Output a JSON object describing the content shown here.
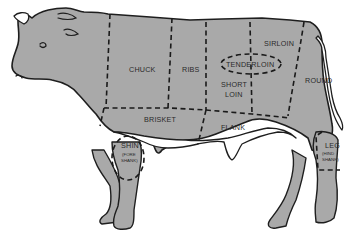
{
  "diagram": {
    "colors": {
      "body_fill": "#a9a9a9",
      "outline": "#1e1e1e",
      "background": "#ffffff"
    },
    "cuts": [
      {
        "id": "chuck",
        "label": "CHUCK"
      },
      {
        "id": "ribs",
        "label": "RIBS"
      },
      {
        "id": "sirloin",
        "label": "SIRLOIN"
      },
      {
        "id": "tenderloin",
        "label": "TENDERLOIN"
      },
      {
        "id": "short-loin",
        "label_line1": "SHORT",
        "label_line2": "LOIN"
      },
      {
        "id": "round",
        "label": "ROUND"
      },
      {
        "id": "brisket",
        "label": "BRISKET"
      },
      {
        "id": "flank",
        "label": "FLANK"
      },
      {
        "id": "shin",
        "label": "SHIN",
        "sub_line1": "(FORE",
        "sub_line2": "SHANK)"
      },
      {
        "id": "leg",
        "label": "LEG",
        "sub_line1": "(HIND",
        "sub_line2": "SHANK)"
      }
    ]
  }
}
